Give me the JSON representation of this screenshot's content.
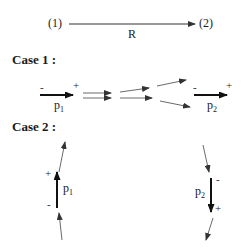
{
  "header": {
    "from_label": "(1)",
    "to_label": "(2)",
    "arrow_label": "R"
  },
  "case1": {
    "title": "Case 1 :",
    "p1": {
      "minus": "-",
      "plus": "+",
      "name": "p",
      "sub": "1"
    },
    "p2": {
      "minus": "-",
      "plus": "+",
      "name": "p",
      "sub": "2"
    }
  },
  "case2": {
    "title": "Case 2 :",
    "p1": {
      "minus": "-",
      "plus": "+",
      "name": "p",
      "sub": "1"
    },
    "p2": {
      "minus": "-",
      "plus": "+",
      "name": "p",
      "sub": "2"
    }
  }
}
